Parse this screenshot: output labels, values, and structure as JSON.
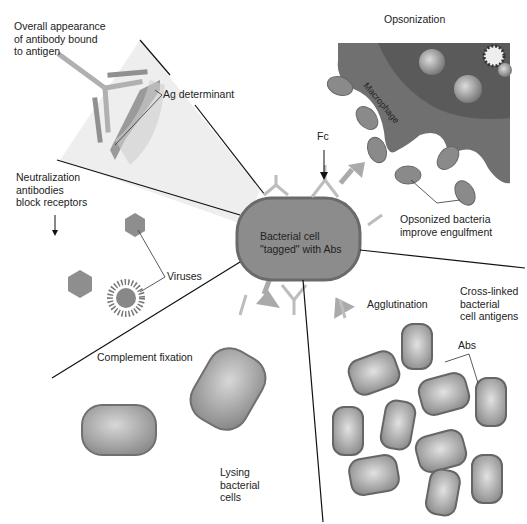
{
  "diagram": {
    "central": {
      "label_line1": "Bacterial cell",
      "label_line2": "\"tagged\" with Abs",
      "fc_label": "Fc"
    },
    "panels": {
      "antibody_binding": {
        "line1": "Overall appearance",
        "line2": "of antibody bound",
        "line3": "to antigen",
        "ag_label": "Ag determinant"
      },
      "opsonization": {
        "title": "Opsonization",
        "macrophage": "Macrophage",
        "caption_line1": "Opsonized bacteria",
        "caption_line2": "improve engulfment"
      },
      "neutralization": {
        "line1": "Neutralization",
        "line2": "antibodies",
        "line3": "block receptors",
        "viruses": "Viruses"
      },
      "complement": {
        "title": "Complement fixation",
        "lysing_line1": "Lysing",
        "lysing_line2": "bacterial",
        "lysing_line3": "cells"
      },
      "agglutination": {
        "title": "Agglutination",
        "cross_line1": "Cross-linked",
        "cross_line2": "bacterial",
        "cross_line3": "cell antigens",
        "abs": "Abs"
      }
    },
    "colors": {
      "cell": "#8e8e8e",
      "cell_edge": "#6a6a6a",
      "antibody": "#b8b8b8",
      "macrophage": "#6e6e6e",
      "wedge": "#ececec",
      "line": "#111111"
    }
  }
}
